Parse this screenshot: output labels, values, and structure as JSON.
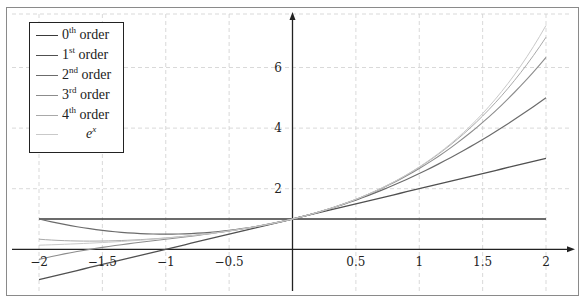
{
  "chart_data": {
    "type": "line",
    "title": "",
    "xlabel": "",
    "ylabel": "",
    "xlim": [
      -2,
      2
    ],
    "ylim": [
      -1.4,
      7.75
    ],
    "grid": true,
    "grid_style": "dashed",
    "legend_position": "top-left",
    "x_ticks": [
      -2,
      -1.5,
      -1,
      -0.5,
      0.5,
      1,
      1.5,
      2
    ],
    "x_tick_labels": [
      "−2",
      "−1.5",
      "−1",
      "−0.5",
      "0.5",
      "1",
      "1.5",
      "2"
    ],
    "y_ticks": [
      2,
      4,
      6
    ],
    "y_tick_labels": [
      "2",
      "4",
      "6"
    ],
    "x": [
      -2,
      -1.5,
      -1,
      -0.5,
      0,
      0.5,
      1,
      1.5,
      2
    ],
    "series": [
      {
        "name": "0th order",
        "sup": "th",
        "base": "0",
        "formula": "1",
        "color": "#3a3a3a",
        "width": 1.4,
        "values": [
          1,
          1,
          1,
          1,
          1,
          1,
          1,
          1,
          1
        ]
      },
      {
        "name": "1st order",
        "sup": "st",
        "base": "1",
        "formula": "1+x",
        "color": "#505050",
        "width": 1.3,
        "values": [
          -1,
          -0.5,
          0,
          0.5,
          1,
          1.5,
          2,
          2.5,
          3
        ]
      },
      {
        "name": "2nd order",
        "sup": "nd",
        "base": "2",
        "formula": "1+x+x^2/2",
        "color": "#6b6b6b",
        "width": 1.2,
        "values": [
          1,
          0.625,
          0.5,
          0.625,
          1,
          1.625,
          2.5,
          3.625,
          5
        ]
      },
      {
        "name": "3rd order",
        "sup": "rd",
        "base": "3",
        "formula": "1+x+x^2/2+x^3/6",
        "color": "#8c8c8c",
        "width": 1.1,
        "values": [
          -0.333,
          0.063,
          0.333,
          0.604,
          1,
          1.646,
          2.667,
          4.188,
          6.333
        ]
      },
      {
        "name": "4th order",
        "sup": "th",
        "base": "4",
        "formula": "1+x+x^2/2+x^3/6+x^4/24",
        "color": "#a9a9a9",
        "width": 1.0,
        "values": [
          0.333,
          0.273,
          0.375,
          0.607,
          1,
          1.648,
          2.708,
          4.398,
          7
        ]
      },
      {
        "name": "e^x",
        "sup": "x",
        "base": "e",
        "formula": "exp(x)",
        "color": "#c9c9c9",
        "width": 1.0,
        "values": [
          0.135,
          0.223,
          0.368,
          0.607,
          1,
          1.649,
          2.718,
          4.482,
          7.389
        ]
      }
    ]
  },
  "legend": {
    "items": [
      {
        "base": "0",
        "sup": "th",
        "suffix": " order"
      },
      {
        "base": "1",
        "sup": "st",
        "suffix": " order"
      },
      {
        "base": "2",
        "sup": "nd",
        "suffix": " order"
      },
      {
        "base": "3",
        "sup": "rd",
        "suffix": " order"
      },
      {
        "base": "4",
        "sup": "th",
        "suffix": " order"
      },
      {
        "base": "e",
        "sup": "x",
        "suffix": ""
      }
    ]
  },
  "colors": {
    "axis": "#222222",
    "grid": "#cfcfcf",
    "frame": "#8a8a8a"
  }
}
